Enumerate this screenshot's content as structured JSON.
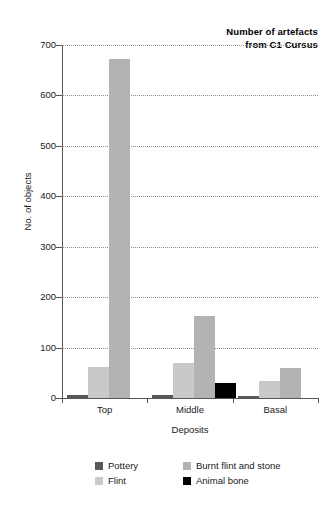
{
  "chart_data": {
    "type": "bar",
    "title": "Number of artefacts\nfrom C1 Cursus",
    "xlabel": "Deposits",
    "ylabel": "No. of objects",
    "categories": [
      "Top",
      "Middle",
      "Basal"
    ],
    "ylim": [
      0,
      700
    ],
    "ytick_step": 100,
    "yticks": [
      0,
      100,
      200,
      300,
      400,
      500,
      600,
      700
    ],
    "ytick_labels": [
      "0",
      "100",
      "200",
      "300",
      "400",
      "500",
      "600",
      "700"
    ],
    "grid": true,
    "grid_axis": "y",
    "grid_style": "dotted",
    "legend_position": "bottom",
    "series": [
      {
        "name": "Pottery",
        "color": "#595959",
        "values": [
          6,
          6,
          4
        ]
      },
      {
        "name": "Flint",
        "color": "#c9c9c9",
        "values": [
          62,
          70,
          33
        ]
      },
      {
        "name": "Burnt flint and stone",
        "color": "#b3b3b3",
        "values": [
          672,
          162,
          60
        ]
      },
      {
        "name": "Animal bone",
        "color": "#000000",
        "values": [
          0,
          30,
          0
        ]
      }
    ]
  },
  "colors": {
    "axis": "#555555",
    "grid": "#8d8d8d",
    "text": "#1a1a1a",
    "background": "#ffffff"
  }
}
